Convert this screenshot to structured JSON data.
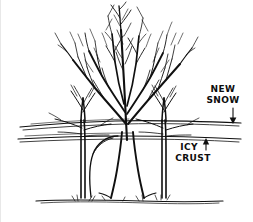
{
  "figure": {
    "background_color": "#ffffff",
    "ink_color": "#101010",
    "width": 253,
    "height": 222
  },
  "annotations": {
    "new_snow": {
      "line1": "NEW",
      "line2": "SNOW",
      "arrow_icon": "arrow-down-icon",
      "arrow_direction": "down"
    },
    "icy_crust": {
      "line1": "ICY",
      "line2": "CRUST",
      "arrow_icon": "arrow-up-icon",
      "arrow_direction": "up"
    }
  },
  "scene": {
    "layers": [
      {
        "name": "new-snow-surface",
        "label": "NEW SNOW"
      },
      {
        "name": "icy-crust-layer",
        "label": "ICY CRUST"
      },
      {
        "name": "ground-line",
        "label": ""
      }
    ],
    "trees": [
      {
        "name": "left-tree",
        "kind": "sapling"
      },
      {
        "name": "center-tree",
        "kind": "mature"
      },
      {
        "name": "right-tree",
        "kind": "sapling"
      }
    ]
  }
}
